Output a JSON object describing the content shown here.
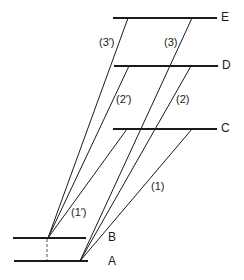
{
  "levels": [
    {
      "id": "E",
      "label": "E",
      "y": 18,
      "x1": 113,
      "x2": 217
    },
    {
      "id": "D",
      "label": "D",
      "y": 66,
      "x1": 114,
      "x2": 218
    },
    {
      "id": "C",
      "label": "C",
      "y": 129,
      "x1": 113,
      "x2": 217
    },
    {
      "id": "B",
      "label": "B",
      "y": 238,
      "x1": 13,
      "x2": 86
    },
    {
      "id": "A",
      "label": "A",
      "y": 261,
      "x1": 14,
      "x2": 88
    }
  ],
  "transitions": [
    {
      "label": "(1)",
      "from": "A",
      "to": "C"
    },
    {
      "label": "(2)",
      "from": "A",
      "to": "D"
    },
    {
      "label": "(3)",
      "from": "A",
      "to": "E"
    },
    {
      "label": "(1′)",
      "from": "B",
      "to": "C"
    },
    {
      "label": "(2′)",
      "from": "B",
      "to": "D"
    },
    {
      "label": "(3′)",
      "from": "B",
      "to": "E"
    }
  ],
  "colors": {
    "line": "#1a1a1a",
    "background": "#ffffff"
  }
}
